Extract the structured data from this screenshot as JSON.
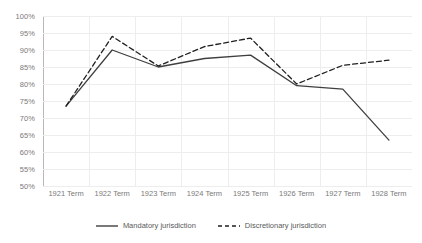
{
  "chart_data": {
    "type": "line",
    "title": "",
    "xlabel": "",
    "ylabel": "",
    "categories": [
      "1921 Term",
      "1922 Term",
      "1923 Term",
      "1924 Term",
      "1925 Term",
      "1926 Term",
      "1927 Term",
      "1928 Term"
    ],
    "ylim": [
      50,
      100
    ],
    "ytick_labels": [
      "100%",
      "95%",
      "90%",
      "85%",
      "80%",
      "75%",
      "70%",
      "65%",
      "60%",
      "55%",
      "50%"
    ],
    "ytick_values": [
      100,
      95,
      90,
      85,
      80,
      75,
      70,
      65,
      60,
      55,
      50
    ],
    "ytick_format": "percent",
    "grid": true,
    "grid_axes": "both",
    "legend_position": "bottom",
    "series": [
      {
        "name": "Mandatory jurisdiction",
        "style": "solid",
        "color": "#3f3f3f",
        "values": [
          73.5,
          90.0,
          85.0,
          87.5,
          88.5,
          79.5,
          78.5,
          63.5
        ]
      },
      {
        "name": "Discretionary jurisdiction",
        "style": "dashed",
        "color": "#1f1f1f",
        "values": [
          73.5,
          94.0,
          85.3,
          91.0,
          93.5,
          80.0,
          85.5,
          87.0
        ]
      }
    ]
  },
  "axis": {
    "line_color": "#b8b8b8",
    "grid_color": "#ededed",
    "tick_text_color": "#7a7a7a"
  }
}
